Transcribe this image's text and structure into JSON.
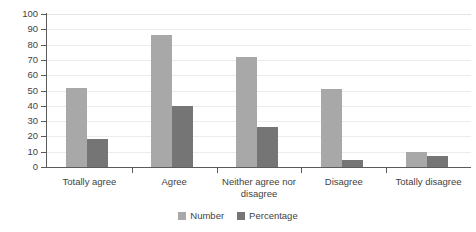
{
  "chart_data": {
    "type": "bar",
    "title": "",
    "subtitle": "",
    "xlabel": "",
    "ylabel": "",
    "ylim": [
      0,
      100
    ],
    "ytick_step": 10,
    "yticks": [
      0,
      10,
      20,
      30,
      40,
      50,
      60,
      70,
      80,
      90,
      100
    ],
    "categories": [
      "Totally agree",
      "Agree",
      "Neither agree nor disagree",
      "Disagree",
      "Totally disagree"
    ],
    "series": [
      {
        "name": "Number",
        "color": "#a8a8a8",
        "values": [
          51.5,
          86,
          72,
          51,
          10
        ]
      },
      {
        "name": "Percentage",
        "color": "#757575",
        "values": [
          18,
          40,
          26,
          4.5,
          7.5
        ]
      }
    ],
    "grid": true,
    "grid_axis": "y",
    "legend_position": "bottom",
    "annotations": []
  },
  "colors": {
    "background": "#ffffff",
    "axis": "#5b5b5b",
    "gridline": "#ececed",
    "text": "#3f3f3f",
    "series_number": "#a8a8a8",
    "series_percentage": "#757575"
  }
}
